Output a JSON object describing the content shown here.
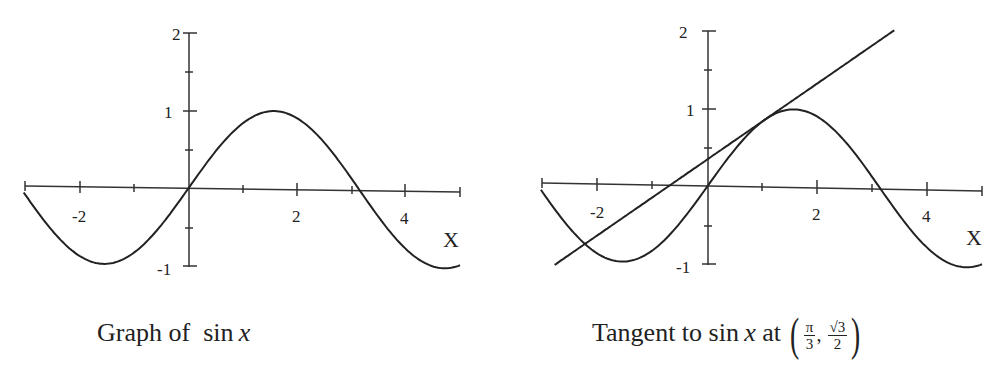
{
  "chart_data": [
    {
      "type": "line",
      "title": "Graph of sin x",
      "xlabel": "X",
      "ylabel": "",
      "xlim": [
        -3.05,
        5.0
      ],
      "ylim": [
        -1,
        2
      ],
      "x_ticks": [
        -2,
        2,
        4
      ],
      "x_minor_ticks": [
        -3,
        -2,
        -1,
        1,
        2,
        3,
        4,
        5
      ],
      "y_ticks": [
        -1,
        1,
        2
      ],
      "y_minor_ticks": [
        -0.5,
        0.5,
        1.5
      ],
      "grid": false,
      "series": [
        {
          "name": "sin x",
          "function": "sin(x)",
          "domain": [
            -3.05,
            5.0
          ],
          "x": [
            -3,
            -2,
            -1.5708,
            -1,
            0,
            1,
            1.5708,
            2,
            3,
            3.1416,
            4,
            4.7124,
            5
          ],
          "y": [
            -0.141,
            -0.909,
            -1,
            -0.841,
            0,
            0.841,
            1,
            0.909,
            0.141,
            0,
            -0.757,
            -1,
            -0.959
          ]
        }
      ]
    },
    {
      "type": "line",
      "title": "Tangent to sin x at (π/3, √3/2)",
      "xlabel": "X",
      "ylabel": "",
      "xlim": [
        -3.05,
        5.0
      ],
      "ylim": [
        -1,
        2
      ],
      "x_ticks": [
        -2,
        2,
        4
      ],
      "x_minor_ticks": [
        -3,
        -2,
        -1,
        1,
        2,
        3,
        4,
        5
      ],
      "y_ticks": [
        -1,
        1,
        2
      ],
      "y_minor_ticks": [
        -0.5,
        0.5,
        1.5
      ],
      "grid": false,
      "series": [
        {
          "name": "sin x",
          "function": "sin(x)",
          "domain": [
            -3.05,
            5.0
          ],
          "x": [
            -3,
            -2,
            -1.5708,
            -1,
            0,
            1,
            1.5708,
            2,
            3,
            3.1416,
            4,
            4.7124,
            5
          ],
          "y": [
            -0.141,
            -0.909,
            -1,
            -0.841,
            0,
            0.841,
            1,
            0.909,
            0.141,
            0,
            -0.757,
            -1,
            -0.959
          ]
        },
        {
          "name": "tangent line",
          "function": "0.5*(x - pi/3) + sqrt(3)/2",
          "domain": [
            -2.8,
            3.4
          ],
          "x": [
            -2.8,
            1.0472,
            3.4
          ],
          "y": [
            -0.92,
            0.866,
            2.04
          ]
        }
      ],
      "annotations": [
        {
          "point": [
            1.0472,
            0.866
          ],
          "text": "tangent point (π/3, √3/2)"
        }
      ]
    }
  ],
  "charts": {
    "left": {
      "caption_prefix": "Graph of ",
      "caption_fn": "sin",
      "caption_var": "x",
      "x_axis_label": "X",
      "x_tick_labels": [
        "-2",
        "2",
        "4"
      ],
      "y_tick_labels": [
        "2",
        "1",
        "-1"
      ]
    },
    "right": {
      "caption_prefix": "Tangent to ",
      "caption_fn": "sin",
      "caption_var": "x",
      "caption_at": " at ",
      "point_x_num": "π",
      "point_x_den": "3",
      "point_y_num": "√3",
      "point_y_den": "2",
      "x_axis_label": "X",
      "x_tick_labels": [
        "-2",
        "2",
        "4"
      ],
      "y_tick_labels": [
        "2",
        "1",
        "-1"
      ]
    }
  },
  "style": {
    "line_color": "#222222",
    "background": "#ffffff"
  }
}
